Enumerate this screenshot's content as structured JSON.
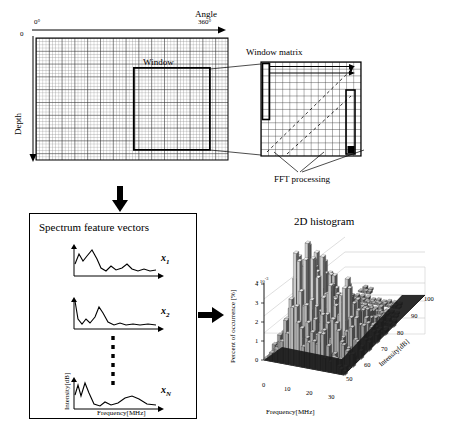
{
  "figure": {
    "title_rf": "RF Matrix",
    "axis_angle_label": "Angle",
    "angle_start": "0°",
    "angle_end": "360°",
    "depth_label": "Depth",
    "depth_origin": "0",
    "window_label": "Window",
    "window_matrix_label": "Window matrix",
    "fft_label": "FFT processing"
  },
  "spectrum": {
    "panel_title": "Spectrum feature vectors",
    "ylabel": "Intensity[dB]",
    "xlabel": "Frequency[MHz]",
    "vectors": [
      {
        "name": "x",
        "sub": "1"
      },
      {
        "name": "x",
        "sub": "2"
      },
      {
        "name": "x",
        "sub": "N"
      }
    ],
    "ellipsis": "vertical-dashed-dots"
  },
  "histogram": {
    "title": "2D histogram"
  },
  "chart_data": {
    "type": "bar",
    "title": "2D histogram",
    "projection": "3d-surface-histogram",
    "xlabel": "Frequency[MHz]",
    "ylabel": "Intensity[dB]",
    "zlabel": "Percent of occurrence [%]",
    "z_exponent": "x 10",
    "z_exponent_sup": "-3",
    "xticks": [
      0,
      10,
      20,
      30
    ],
    "yticks": [
      50,
      60,
      70,
      80,
      90,
      100
    ],
    "zticks": [
      0,
      1,
      2,
      3,
      4
    ],
    "xlim": [
      0,
      35
    ],
    "ylim": [
      50,
      100
    ],
    "zlim": [
      0,
      4.5
    ],
    "grid": true,
    "legend": "none",
    "bars": [
      [
        0.2,
        0.3,
        0.5,
        0.4,
        0.2,
        0.1,
        0.1,
        0.0,
        0.0,
        0.0
      ],
      [
        0.4,
        0.8,
        1.1,
        0.9,
        0.5,
        0.3,
        0.1,
        0.1,
        0.0,
        0.0
      ],
      [
        0.9,
        1.6,
        2.2,
        1.8,
        1.1,
        0.6,
        0.3,
        0.1,
        0.1,
        0.0
      ],
      [
        1.6,
        2.8,
        3.6,
        3.0,
        1.9,
        1.0,
        0.5,
        0.2,
        0.1,
        0.0
      ],
      [
        2.4,
        3.7,
        4.3,
        3.8,
        2.6,
        1.4,
        0.7,
        0.3,
        0.1,
        0.1
      ],
      [
        2.2,
        3.4,
        4.1,
        3.5,
        2.4,
        1.3,
        0.6,
        0.3,
        0.1,
        0.1
      ],
      [
        1.8,
        2.9,
        3.5,
        3.1,
        2.1,
        1.2,
        0.6,
        0.2,
        0.1,
        0.0
      ],
      [
        1.5,
        2.4,
        3.0,
        2.6,
        1.8,
        1.0,
        0.5,
        0.2,
        0.1,
        0.0
      ],
      [
        1.3,
        2.1,
        2.7,
        2.3,
        1.6,
        0.9,
        0.4,
        0.2,
        0.1,
        0.0
      ],
      [
        1.1,
        1.8,
        2.4,
        2.1,
        1.5,
        0.8,
        0.4,
        0.2,
        0.1,
        0.0
      ],
      [
        1.4,
        2.2,
        2.9,
        2.5,
        1.7,
        0.9,
        0.4,
        0.2,
        0.1,
        0.0
      ],
      [
        1.2,
        2.0,
        2.6,
        2.2,
        1.5,
        0.8,
        0.4,
        0.2,
        0.1,
        0.0
      ],
      [
        0.9,
        1.5,
        2.0,
        1.7,
        1.2,
        0.6,
        0.3,
        0.1,
        0.1,
        0.0
      ],
      [
        0.6,
        1.0,
        1.4,
        1.2,
        0.8,
        0.4,
        0.2,
        0.1,
        0.0,
        0.0
      ],
      [
        0.3,
        0.5,
        0.7,
        0.6,
        0.4,
        0.2,
        0.1,
        0.0,
        0.0,
        0.0
      ]
    ]
  }
}
